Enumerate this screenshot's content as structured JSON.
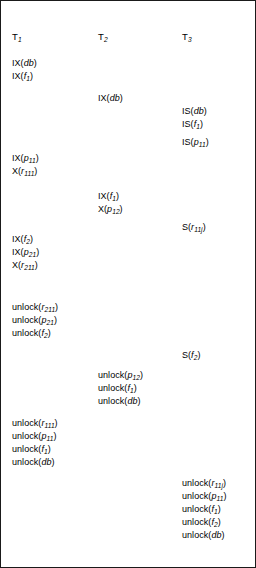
{
  "figure": {
    "columns": [
      {
        "id": "t1",
        "header": "T",
        "header_sub": "1",
        "operations": [
          {
            "mode": "IX",
            "resource": "db",
            "sub": "",
            "y": 57
          },
          {
            "mode": "IX",
            "resource": "f",
            "sub": "1",
            "y": 70
          },
          {
            "mode": "IX",
            "resource": "p",
            "sub": "11",
            "y": 152
          },
          {
            "mode": "X",
            "resource": "r",
            "sub": "111",
            "y": 165
          },
          {
            "mode": "IX",
            "resource": "f",
            "sub": "2",
            "y": 233
          },
          {
            "mode": "IX",
            "resource": "p",
            "sub": "21",
            "y": 246
          },
          {
            "mode": "X",
            "resource": "r",
            "sub": "211",
            "y": 259
          },
          {
            "mode": "unlock",
            "resource": "r",
            "sub": "211",
            "y": 301
          },
          {
            "mode": "unlock",
            "resource": "p",
            "sub": "21",
            "y": 314
          },
          {
            "mode": "unlock",
            "resource": "f",
            "sub": "2",
            "y": 327
          },
          {
            "mode": "unlock",
            "resource": "r",
            "sub": "111",
            "y": 417
          },
          {
            "mode": "unlock",
            "resource": "p",
            "sub": "11",
            "y": 430
          },
          {
            "mode": "unlock",
            "resource": "f",
            "sub": "1",
            "y": 443
          },
          {
            "mode": "unlock",
            "resource": "db",
            "sub": "",
            "y": 456
          }
        ]
      },
      {
        "id": "t2",
        "header": "T",
        "header_sub": "2",
        "operations": [
          {
            "mode": "IX",
            "resource": "db",
            "sub": "",
            "y": 92
          },
          {
            "mode": "IX",
            "resource": "f",
            "sub": "1",
            "y": 190
          },
          {
            "mode": "X",
            "resource": "p",
            "sub": "12",
            "y": 203
          },
          {
            "mode": "unlock",
            "resource": "p",
            "sub": "12",
            "y": 369
          },
          {
            "mode": "unlock",
            "resource": "f",
            "sub": "1",
            "y": 382
          },
          {
            "mode": "unlock",
            "resource": "db",
            "sub": "",
            "y": 395
          }
        ]
      },
      {
        "id": "t3",
        "header": "T",
        "header_sub": "3",
        "operations": [
          {
            "mode": "IS",
            "resource": "db",
            "sub": "",
            "y": 105
          },
          {
            "mode": "IS",
            "resource": "f",
            "sub": "1",
            "y": 118
          },
          {
            "mode": "IS",
            "resource": "p",
            "sub": "11",
            "y": 136
          },
          {
            "mode": "S",
            "resource": "r",
            "sub": "11j",
            "y": 221
          },
          {
            "mode": "S",
            "resource": "f",
            "sub": "2",
            "y": 349
          },
          {
            "mode": "unlock",
            "resource": "r",
            "sub": "11j",
            "y": 477
          },
          {
            "mode": "unlock",
            "resource": "p",
            "sub": "11",
            "y": 490
          },
          {
            "mode": "unlock",
            "resource": "f",
            "sub": "1",
            "y": 503
          },
          {
            "mode": "unlock",
            "resource": "f",
            "sub": "2",
            "y": 516
          },
          {
            "mode": "unlock",
            "resource": "db",
            "sub": "",
            "y": 529
          }
        ]
      }
    ],
    "header_y": 30
  }
}
